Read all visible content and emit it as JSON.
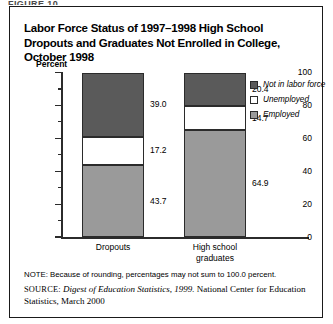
{
  "figure_caption_sliver": "FIGURE 10",
  "figure": {
    "title": "Labor Force Status of 1997–1998 High School Dropouts and Graduates Not Enrolled in College, October 1998"
  },
  "legend": {
    "items": [
      {
        "label": "Not in labor force",
        "color": "#5a5a5a",
        "name": "not-in-labor-force"
      },
      {
        "label": "Unemployed",
        "color": "#ffffff",
        "name": "unemployed"
      },
      {
        "label": "Employed",
        "color": "#9a9a9a",
        "name": "employed"
      }
    ]
  },
  "notes": {
    "note": "NOTE: Because of rounding, percentages may not sum to 100.0 percent.",
    "source_prefix": "SOURCE:",
    "source_italic": "Digest of Education Statistics, 1999.",
    "source_rest": " National Center for Education Statistics, March 2000"
  },
  "chart_data": {
    "type": "bar",
    "stacked": true,
    "title": "Labor Force Status of 1997–1998 High School Dropouts and Graduates Not Enrolled in College, October 1998",
    "xlabel": "",
    "ylabel": "Percent",
    "ylim": [
      0,
      100
    ],
    "yticks": [
      0,
      20,
      40,
      60,
      80,
      100
    ],
    "yticks_minor": [
      10,
      30,
      50,
      70,
      90
    ],
    "ytick_labels": [
      "0",
      "20",
      "40",
      "60",
      "80",
      "100"
    ],
    "grid": false,
    "legend_position": "right",
    "categories": [
      "Dropouts",
      "High school graduates"
    ],
    "category_lines": [
      [
        "Dropouts"
      ],
      [
        "High school",
        "graduates"
      ]
    ],
    "series": [
      {
        "name": "Employed",
        "color": "#9a9a9a",
        "values": [
          43.7,
          64.9
        ]
      },
      {
        "name": "Unemployed",
        "color": "#ffffff",
        "values": [
          17.2,
          14.7
        ]
      },
      {
        "name": "Not in labor force",
        "color": "#5a5a5a",
        "values": [
          39.0,
          20.4
        ]
      }
    ],
    "data_labels": {
      "Dropouts": {
        "Not in labor force": "39.0",
        "Unemployed": "17.2",
        "Employed": "43.7"
      },
      "High school graduates": {
        "Not in labor force": "20.4",
        "Unemployed": "14.7",
        "Employed": "64.9"
      }
    }
  }
}
